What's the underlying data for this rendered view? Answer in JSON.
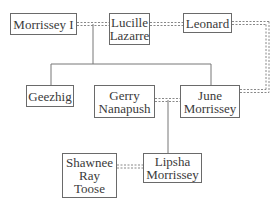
{
  "diagram": {
    "type": "family-tree",
    "nodes": [
      {
        "id": "morrissey_i",
        "label": "Morrissey I"
      },
      {
        "id": "lucille",
        "label": "Lucille Lazarre"
      },
      {
        "id": "leonard",
        "label": "Leonard"
      },
      {
        "id": "geezhig",
        "label": "Geezhig"
      },
      {
        "id": "gerry",
        "label": "Gerry Nanapush"
      },
      {
        "id": "june",
        "label": "June Morrissey"
      },
      {
        "id": "shawnee",
        "label": "Shawnee Ray Toose"
      },
      {
        "id": "lipsha",
        "label": "Lipsha Morrissey"
      }
    ],
    "edges": [
      {
        "from": "morrissey_i",
        "to": "lucille",
        "style": "dashed-double",
        "relation": "partner"
      },
      {
        "from": "lucille",
        "to": "leonard",
        "style": "dashed-double",
        "relation": "partner"
      },
      {
        "from": "leonard",
        "to": "june",
        "style": "dashed-double",
        "relation": "partner"
      },
      {
        "from": "gerry",
        "to": "june",
        "style": "dashed-double",
        "relation": "partner"
      },
      {
        "from": "shawnee",
        "to": "lipsha",
        "style": "dashed-double",
        "relation": "partner"
      },
      {
        "from": "morrissey_i+lucille",
        "to": "geezhig",
        "style": "solid",
        "relation": "child"
      },
      {
        "from": "morrissey_i+lucille",
        "to": "june",
        "style": "solid",
        "relation": "child"
      },
      {
        "from": "gerry+june",
        "to": "lipsha",
        "style": "solid",
        "relation": "child"
      }
    ]
  },
  "labels": {
    "morrissey_i": "Morrissey I",
    "lucille_1": "Lucille",
    "lucille_2": "Lazarre",
    "leonard": "Leonard",
    "geezhig": "Geezhig",
    "gerry_1": "Gerry",
    "gerry_2": "Nanapush",
    "june_1": "June",
    "june_2": "Morrissey",
    "shawnee_1": "Shawnee",
    "shawnee_2": "Ray",
    "shawnee_3": "Toose",
    "lipsha_1": "Lipsha",
    "lipsha_2": "Morrissey"
  }
}
